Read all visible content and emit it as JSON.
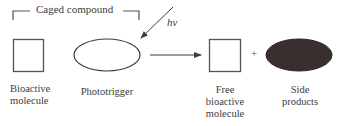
{
  "diagram": {
    "title_bracket_label": "Caged compound",
    "light_label": "hv",
    "plus_sign": "+",
    "nodes": [
      {
        "id": "bioactive-molecule",
        "shape": "square",
        "fill": "#ffffff",
        "label_lines": [
          "Bioactive",
          "molecule"
        ]
      },
      {
        "id": "phototrigger",
        "shape": "ellipse",
        "fill": "#ffffff",
        "label_lines": [
          "Phototrigger"
        ]
      },
      {
        "id": "free-bioactive-molecule",
        "shape": "square",
        "fill": "#ffffff",
        "label_lines": [
          "Free",
          "bioactive",
          "molecule"
        ]
      },
      {
        "id": "side-products",
        "shape": "ellipse",
        "fill": "#3a2f2f",
        "label_lines": [
          "Side",
          "products"
        ]
      }
    ],
    "edges": [
      {
        "from": "light",
        "to": "phototrigger",
        "label": "hv"
      },
      {
        "from": "caged-compound",
        "to": "free-bioactive-molecule"
      }
    ],
    "colors": {
      "stroke": "#3c3c3c",
      "side_product_fill": "#3a2f2f",
      "background": "#ffffff"
    }
  }
}
